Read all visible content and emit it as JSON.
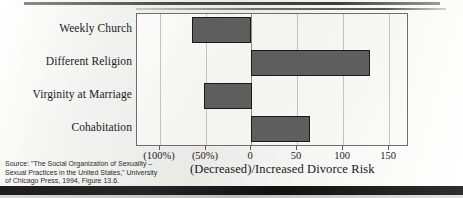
{
  "slide": {
    "source_note_lines": [
      "Source: \"The Social Organization of Sexuality –",
      "Sexual Practices in the United States,\" University",
      "of Chicago Press, 1994, Figure 13.6."
    ]
  },
  "chart_data": {
    "type": "bar",
    "orientation": "horizontal",
    "title": "",
    "xlabel": "(Decreased)/Increased Divorce Risk",
    "ylabel": "",
    "categories": [
      "Weekly Church",
      "Different Religion",
      "Virginity at Marriage",
      "Cohabitation"
    ],
    "values": [
      -65,
      130,
      -52,
      65
    ],
    "value_labels": [
      "(65%)",
      "130",
      "(52%)",
      "65"
    ],
    "xlim": [
      -125,
      170
    ],
    "xticks": [
      -100,
      -50,
      0,
      50,
      100,
      150
    ],
    "xticklabels": [
      "(100%)",
      "(50%)",
      "0",
      "50",
      "100",
      "150"
    ],
    "grid": true,
    "grid_axis": "x",
    "legend": "none",
    "bar_color": "#5e5e5e",
    "bar_edge_color": "#1a1a1a",
    "plot_bg": "#f7f7f5",
    "axis_color": "#6e6e6e",
    "gridline_color": "#c3c3bd"
  }
}
